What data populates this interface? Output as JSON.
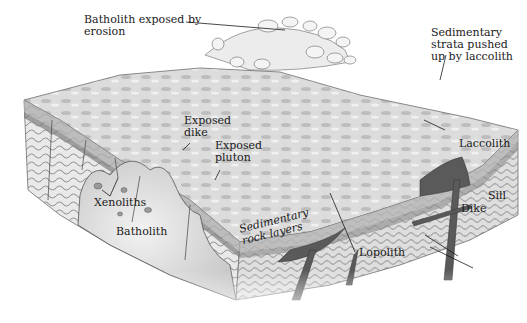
{
  "diagram": {
    "colors": {
      "background": "#ffffff",
      "surface": "#d9d9d9",
      "strata_light": "#e6e6e6",
      "strata_dark": "#8c8c8c",
      "intrusion": "#555555",
      "batholith": "#cfcfcf",
      "text": "#1a1a1a"
    },
    "labels": {
      "batholith_exposed": "Batholith exposed by\nerosion",
      "sedimentary_strata_pushed": "Sedimentary\nstrata pushed\nup by laccolith",
      "exposed_dike": "Exposed\ndike",
      "exposed_pluton": "Exposed\npluton",
      "laccolith": "Laccolith",
      "xenoliths": "Xenoliths",
      "batholith": "Batholith",
      "sedimentary_rock_layers": "Sedimentary\nrock layers",
      "sill": "Sill",
      "dike": "Dike",
      "lopolith": "Lopolith"
    }
  }
}
